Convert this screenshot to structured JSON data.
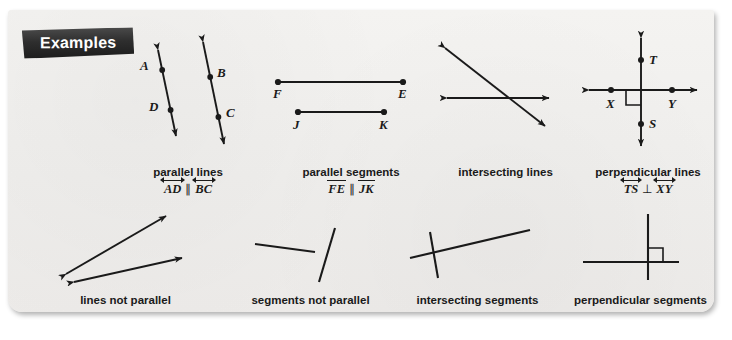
{
  "banner": {
    "label": "Examples"
  },
  "figures": {
    "parallel_lines": {
      "caption": "parallel lines",
      "notation": {
        "left": "AD",
        "symbol": "∥",
        "right": "BC",
        "mark": "line"
      },
      "points": [
        {
          "label": "A"
        },
        {
          "label": "B"
        },
        {
          "label": "C"
        },
        {
          "label": "D"
        }
      ]
    },
    "parallel_segments": {
      "caption": "parallel segments",
      "notation": {
        "left": "FE",
        "symbol": "∥",
        "right": "JK",
        "mark": "seg"
      },
      "points": [
        {
          "label": "F"
        },
        {
          "label": "E"
        },
        {
          "label": "J"
        },
        {
          "label": "K"
        }
      ]
    },
    "intersecting_lines": {
      "caption": "intersecting lines",
      "notation": null,
      "points": []
    },
    "perpendicular_lines": {
      "caption": "perpendicular lines",
      "notation": {
        "left": "TS",
        "symbol": "⊥",
        "right": "XY",
        "mark": "line"
      },
      "points": [
        {
          "label": "T"
        },
        {
          "label": "X"
        },
        {
          "label": "Y"
        },
        {
          "label": "S"
        }
      ]
    },
    "lines_not_parallel": {
      "caption": "lines not parallel",
      "notation": null,
      "points": []
    },
    "segments_not_parallel": {
      "caption": "segments not parallel",
      "notation": null,
      "points": []
    },
    "intersecting_segments": {
      "caption": "intersecting segments",
      "notation": null,
      "points": []
    },
    "perpendicular_segments": {
      "caption": "perpendicular segments",
      "notation": null,
      "points": []
    }
  },
  "colors": {
    "ink": "#1a1a1a",
    "card": "#f2f1ef",
    "banner": "#2e2e2e",
    "banner_text": "#ffffff"
  }
}
